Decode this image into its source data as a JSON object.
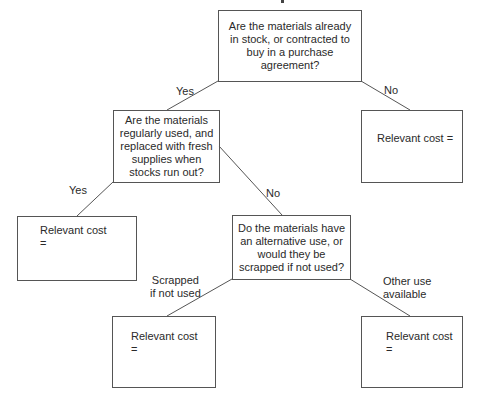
{
  "diagram": {
    "type": "decision-tree",
    "nodes": [
      {
        "id": "q1",
        "kind": "question",
        "text": "Are the materials already in stock, or contracted to buy in a purchase agreement?"
      },
      {
        "id": "q2",
        "kind": "question",
        "text": "Are the materials regularly used, and replaced with fresh supplies when stocks run out?"
      },
      {
        "id": "r1",
        "kind": "result",
        "text": "Relevant cost ="
      },
      {
        "id": "r2",
        "kind": "result",
        "text": "Relevant cost\n="
      },
      {
        "id": "q3",
        "kind": "question",
        "text": "Do the materials have an alternative use, or would they be scrapped if not used?"
      },
      {
        "id": "r3",
        "kind": "result",
        "text": "Relevant cost\n="
      },
      {
        "id": "r4",
        "kind": "result",
        "text": "Relevant cost\n="
      }
    ],
    "edges": [
      {
        "from": "q1",
        "to": "q2",
        "label": "Yes"
      },
      {
        "from": "q1",
        "to": "r1",
        "label": "No"
      },
      {
        "from": "q2",
        "to": "r2",
        "label": "Yes"
      },
      {
        "from": "q2",
        "to": "q3",
        "label": "No"
      },
      {
        "from": "q3",
        "to": "r3",
        "label": "Scrapped\nif not used"
      },
      {
        "from": "q3",
        "to": "r4",
        "label": "Other use\navailable"
      }
    ]
  },
  "colors": {
    "line": "#555555",
    "text": "#2a2a2a",
    "background": "#ffffff"
  }
}
